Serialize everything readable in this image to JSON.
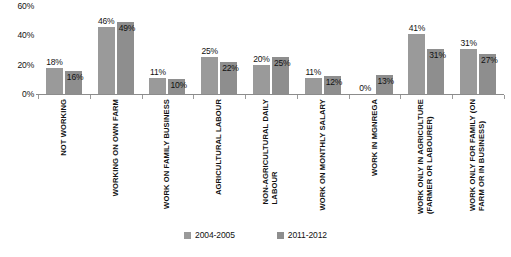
{
  "chart_data": {
    "type": "bar",
    "title": "",
    "subtitle": "",
    "xlabel": "",
    "ylabel": "",
    "ylim": [
      0,
      60
    ],
    "yticks": [
      "0%",
      "20%",
      "40%",
      "60%"
    ],
    "grid": false,
    "legend_position": "bottom",
    "categories": [
      "NOT WORKING",
      "WORKING ON OWN FARM",
      "WORK ON FAMILY BUSINESS",
      "AGRICULTURAL LABOUR",
      "NON-AGRICULTURAL DAILY LABOUR",
      "WORK ON MONTHLY SALARY",
      "WORK IN MGNREGA",
      "WORK ONLY IN AGRICULTURE (FARMER OR LABOURER)",
      "WORK ONLY FOR FAMILY (ON FARM OR IN BUSINESS)"
    ],
    "categories_lines": [
      [
        "NOT WORKING"
      ],
      [
        "WORKING ON OWN FARM"
      ],
      [
        "WORK ON FAMILY BUSINESS"
      ],
      [
        "AGRICULTURAL LABOUR"
      ],
      [
        "NON-AGRICULTURAL DAILY",
        "LABOUR"
      ],
      [
        "WORK ON MONTHLY SALARY"
      ],
      [
        "WORK IN MGNREGA"
      ],
      [
        "WORK ONLY IN AGRICULTURE",
        "(FARMER OR LABOURER)"
      ],
      [
        "WORK ONLY FOR FAMILY (ON",
        "FARM OR IN BUSINESS)"
      ]
    ],
    "series": [
      {
        "name": "2004-2005",
        "color": "#9a9a9a",
        "values": [
          18,
          46,
          11,
          25,
          20,
          11,
          0,
          41,
          31
        ],
        "labels": [
          "18%",
          "46%",
          "11%",
          "25%",
          "20%",
          "11%",
          "0%",
          "41%",
          "31%"
        ]
      },
      {
        "name": "2011-2012",
        "color": "#8e8e8e",
        "values": [
          16,
          49,
          10,
          22,
          25,
          12,
          13,
          31,
          27
        ],
        "labels": [
          "16%",
          "49%",
          "10%",
          "22%",
          "25%",
          "12%",
          "13%",
          "31%",
          "27%"
        ]
      }
    ]
  },
  "legend": {
    "items": [
      {
        "label": "2004-2005"
      },
      {
        "label": "2011-2012"
      }
    ]
  },
  "axis": {
    "ticks": [
      {
        "label": "60%"
      },
      {
        "label": "40%"
      },
      {
        "label": "20%"
      },
      {
        "label": "0%"
      }
    ]
  }
}
